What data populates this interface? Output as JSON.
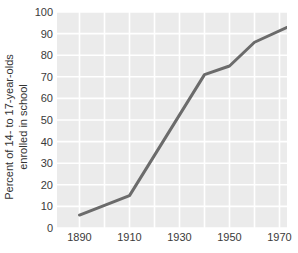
{
  "chart_data": {
    "type": "line",
    "title": "",
    "xlabel": "",
    "ylabel": "Percent of 14- to 17-year-olds enrolled in school",
    "ylabel_lines": [
      "Percent of 14- to 17-year-olds",
      "enrolled in school"
    ],
    "x": [
      1890,
      1910,
      1940,
      1950,
      1960,
      1977
    ],
    "values": [
      6,
      15,
      71,
      75,
      86,
      95
    ],
    "series": [
      {
        "name": "Percent enrolled in school",
        "x": [
          1890,
          1910,
          1940,
          1950,
          1960,
          1977
        ],
        "values": [
          6,
          15,
          71,
          75,
          86,
          95
        ]
      }
    ],
    "xlim": [
      1881,
      1973
    ],
    "ylim": [
      0,
      100
    ],
    "x_ticks": [
      1890,
      1910,
      1930,
      1950,
      1970
    ],
    "x_tick_labels": [
      "1890",
      "1910",
      "1930",
      "1950",
      "1970"
    ],
    "y_ticks": [
      0,
      10,
      20,
      30,
      40,
      50,
      60,
      70,
      80,
      90,
      100
    ],
    "y_tick_labels": [
      "0",
      "10",
      "20",
      "30",
      "40",
      "50",
      "60",
      "70",
      "80",
      "90",
      "100"
    ],
    "grid": true,
    "grid_color": "#ffffff",
    "plot_background": "#ebebeb",
    "line_color": "#6b6b6b",
    "line_width": 3,
    "legend": "none",
    "legend_position": "none"
  },
  "axes": {
    "y_title_line1": "Percent of 14- to 17-year-olds",
    "y_title_line2": "enrolled in school",
    "y_labels": [
      "100",
      "90",
      "80",
      "70",
      "60",
      "50",
      "40",
      "30",
      "20",
      "10",
      "0"
    ],
    "x_labels": [
      "1890",
      "1910",
      "1930",
      "1950",
      "1970"
    ]
  },
  "colors": {
    "line": "#6b6b6b",
    "plot_bg": "#ebebeb",
    "grid": "#ffffff",
    "text": "#3a3a3a",
    "page_bg": "#ffffff"
  }
}
